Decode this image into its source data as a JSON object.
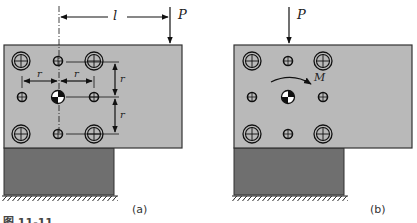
{
  "figure_a": {
    "label": "(a)",
    "load_label": "P",
    "distance_label": "l",
    "spacing_labels": [
      "r",
      "r",
      "r",
      "r"
    ]
  },
  "figure_b": {
    "label": "(b)",
    "load_label": "P",
    "moment_label": "M"
  },
  "caption": "图 11-11",
  "colors": {
    "plate": "#b9b9b9",
    "base": "#6f6f6f",
    "outline": "#333333",
    "line": "#111111"
  }
}
